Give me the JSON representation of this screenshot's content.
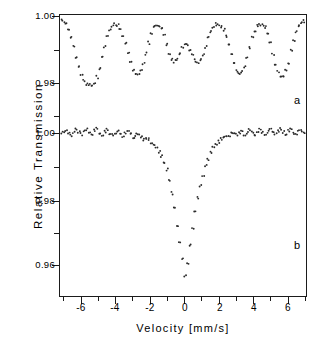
{
  "figure": {
    "panel_label_a": "a",
    "panel_label_b": "b"
  },
  "axes": {
    "xtitle": "Velocity  [mm/s]",
    "ytitle": "Relative   Transmission",
    "xticklabels": [
      "-6",
      "-4",
      "-2",
      "0",
      "2",
      "4",
      "6"
    ],
    "yticklabels_a": [
      "1.00",
      "0.98"
    ],
    "yticklabels_b": [
      "1.00",
      "0.98",
      "0.96"
    ]
  },
  "chart_data": {
    "type": "scatter",
    "title": "",
    "subtitle": "",
    "xlabel": "Velocity  [mm/s]",
    "ylabel": "Relative   Transmission",
    "xlim": [
      -7.6,
      7.6
    ],
    "xticks": [
      -6,
      -4,
      -2,
      0,
      2,
      4,
      6
    ],
    "xminorticks": [
      -7,
      -5,
      -3,
      -1,
      1,
      3,
      5,
      7
    ],
    "grid": false,
    "legend": null,
    "annotations": [
      {
        "text": "a",
        "x": 6.5,
        "y_panel": "a",
        "note": "upper spectrum label"
      },
      {
        "text": "b",
        "x": 6.5,
        "y_panel": "b",
        "note": "lower spectrum label"
      }
    ],
    "panels": [
      {
        "name": "a",
        "label": "a",
        "ylabel_ticks": [
          1.0,
          0.98
        ],
        "ylim": [
          0.9755,
          1.0015
        ],
        "description": "magnetically split sextet, six absorption lines",
        "baseline": 0.9995,
        "lines": [
          {
            "center": -5.35,
            "depth": 0.0205,
            "width": 0.85
          },
          {
            "center": -3.1,
            "depth": 0.0185,
            "width": 0.8
          },
          {
            "center": -0.9,
            "depth": 0.014,
            "width": 0.7
          },
          {
            "center": 0.95,
            "depth": 0.0135,
            "width": 0.7
          },
          {
            "center": 3.15,
            "depth": 0.019,
            "width": 0.8
          },
          {
            "center": 5.4,
            "depth": 0.02,
            "width": 0.85
          }
        ],
        "series": [
          {
            "name": "spectrum a",
            "x": [
              -7.5,
              -7.35,
              -7.2,
              -7.05,
              -6.9,
              -6.75,
              -6.6,
              -6.45,
              -6.3,
              -6.15,
              -6.0,
              -5.85,
              -5.7,
              -5.55,
              -5.4,
              -5.25,
              -5.1,
              -4.95,
              -4.8,
              -4.65,
              -4.5,
              -4.35,
              -4.2,
              -4.05,
              -3.9,
              -3.75,
              -3.6,
              -3.45,
              -3.3,
              -3.15,
              -3.0,
              -2.85,
              -2.7,
              -2.55,
              -2.4,
              -2.25,
              -2.1,
              -1.95,
              -1.8,
              -1.65,
              -1.5,
              -1.35,
              -1.2,
              -1.05,
              -0.9,
              -0.75,
              -0.6,
              -0.45,
              -0.3,
              -0.15,
              0.0,
              0.15,
              0.3,
              0.45,
              0.6,
              0.75,
              0.9,
              1.05,
              1.2,
              1.35,
              1.5,
              1.65,
              1.8,
              1.95,
              2.1,
              2.25,
              2.4,
              2.55,
              2.7,
              2.85,
              3.0,
              3.15,
              3.3,
              3.45,
              3.6,
              3.75,
              3.9,
              4.05,
              4.2,
              4.35,
              4.5,
              4.65,
              4.8,
              4.95,
              5.1,
              5.25,
              5.4,
              5.55,
              5.7,
              5.85,
              6.0,
              6.15,
              6.3,
              6.45,
              6.6,
              6.75,
              6.9,
              7.05,
              7.2,
              7.35
            ],
            "y": [
              0.9997,
              0.9994,
              0.999,
              0.9985,
              0.9975,
              0.996,
              0.9938,
              0.9908,
              0.9878,
              0.9848,
              0.9826,
              0.9808,
              0.9798,
              0.9793,
              0.9795,
              0.9802,
              0.9818,
              0.9845,
              0.9878,
              0.991,
              0.9938,
              0.9958,
              0.997,
              0.9975,
              0.9972,
              0.9962,
              0.9944,
              0.9918,
              0.9888,
              0.986,
              0.984,
              0.9828,
              0.9827,
              0.9838,
              0.9858,
              0.9888,
              0.992,
              0.9948,
              0.9966,
              0.9974,
              0.9972,
              0.9962,
              0.9942,
              0.9916,
              0.989,
              0.9872,
              0.9865,
              0.9872,
              0.989,
              0.9908,
              0.9918,
              0.9914,
              0.99,
              0.9882,
              0.9868,
              0.9862,
              0.9868,
              0.9884,
              0.9908,
              0.9934,
              0.9954,
              0.9968,
              0.9975,
              0.9975,
              0.997,
              0.9958,
              0.9938,
              0.9912,
              0.9884,
              0.9856,
              0.9836,
              0.9828,
              0.9832,
              0.9848,
              0.9874,
              0.9906,
              0.9936,
              0.9958,
              0.9971,
              0.9975,
              0.9974,
              0.9966,
              0.9948,
              0.992,
              0.9888,
              0.9856,
              0.9832,
              0.982,
              0.9822,
              0.9836,
              0.9862,
              0.9896,
              0.9928,
              0.9952,
              0.9968,
              0.9978,
              0.9984,
              0.9988,
              0.999,
              0.999
            ]
          }
        ]
      },
      {
        "name": "b",
        "label": "b",
        "ylabel_ticks": [
          1.0,
          0.98,
          0.96
        ],
        "ylim": [
          0.9525,
          1.0035
        ],
        "description": "single broad absorption line centred near zero velocity",
        "baseline": 1.0005,
        "lines": [
          {
            "center": -0.05,
            "depth": 0.047,
            "width": 1.1
          }
        ],
        "series": [
          {
            "name": "spectrum b",
            "x": [
              -7.5,
              -7.35,
              -7.2,
              -7.05,
              -6.9,
              -6.75,
              -6.6,
              -6.45,
              -6.3,
              -6.15,
              -6.0,
              -5.85,
              -5.7,
              -5.55,
              -5.4,
              -5.25,
              -5.1,
              -4.95,
              -4.8,
              -4.65,
              -4.5,
              -4.35,
              -4.2,
              -4.05,
              -3.9,
              -3.75,
              -3.6,
              -3.45,
              -3.3,
              -3.15,
              -3.0,
              -2.85,
              -2.7,
              -2.55,
              -2.4,
              -2.25,
              -2.1,
              -1.95,
              -1.8,
              -1.65,
              -1.5,
              -1.35,
              -1.2,
              -1.05,
              -0.9,
              -0.75,
              -0.6,
              -0.45,
              -0.3,
              -0.15,
              0.0,
              0.15,
              0.3,
              0.45,
              0.6,
              0.75,
              0.9,
              1.05,
              1.2,
              1.35,
              1.5,
              1.65,
              1.8,
              1.95,
              2.1,
              2.25,
              2.4,
              2.55,
              2.7,
              2.85,
              3.0,
              3.15,
              3.3,
              3.45,
              3.6,
              3.75,
              3.9,
              4.05,
              4.2,
              4.35,
              4.5,
              4.65,
              4.8,
              4.95,
              5.1,
              5.25,
              5.4,
              5.55,
              5.7,
              5.85,
              6.0,
              6.15,
              6.3,
              6.45,
              6.6,
              6.75,
              6.9,
              7.05,
              7.2,
              7.35
            ],
            "y": [
              1.0008,
              1.0002,
              0.9998,
              1.0006,
              1.001,
              1.0,
              0.9994,
              1.0004,
              1.0009,
              1.0001,
              0.9996,
              1.0005,
              1.0011,
              1.0003,
              0.9997,
              1.0006,
              1.0012,
              1.0002,
              0.9995,
              1.0004,
              1.001,
              1.0,
              0.9993,
              1.0002,
              1.0008,
              0.9999,
              0.9992,
              1.0,
              1.0005,
              0.9996,
              0.9988,
              0.9994,
              0.9998,
              0.999,
              0.9982,
              0.9986,
              0.998,
              0.997,
              0.9962,
              0.9955,
              0.9944,
              0.993,
              0.9912,
              0.9888,
              0.9856,
              0.9818,
              0.9772,
              0.9722,
              0.9672,
              0.962,
              0.9566,
              0.9605,
              0.966,
              0.9712,
              0.976,
              0.9802,
              0.984,
              0.9872,
              0.99,
              0.9922,
              0.994,
              0.9954,
              0.9966,
              0.9974,
              0.998,
              0.9986,
              0.999,
              0.9994,
              0.9998,
              1.0,
              0.9994,
              0.9998,
              1.0004,
              0.9996,
              1.0002,
              1.0008,
              1.0,
              0.9994,
              1.0003,
              1.0009,
              1.0001,
              0.9995,
              1.0004,
              1.001,
              1.0002,
              0.9996,
              1.0005,
              1.0011,
              1.0003,
              0.9997,
              1.0006,
              1.001,
              1.0001,
              0.9995,
              1.0004,
              1.0009,
              1.0,
              1.0006,
              1.0012,
              1.0004
            ]
          }
        ]
      }
    ]
  }
}
